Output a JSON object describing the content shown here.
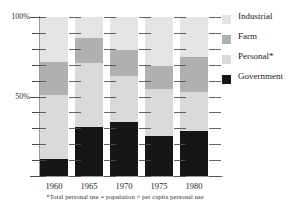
{
  "chart_data": {
    "type": "bar",
    "subtype": "stacked-percentage",
    "title": "",
    "xlabel": "",
    "ylabel": "",
    "categories": [
      "1960",
      "1965",
      "1970",
      "1975",
      "1980"
    ],
    "ylim": [
      0,
      100
    ],
    "ytick_values": [
      0,
      10,
      20,
      30,
      40,
      50,
      60,
      70,
      80,
      90,
      100
    ],
    "ytick_labels_shown": [
      "50%",
      "100%"
    ],
    "grid": false,
    "legend_position": "right",
    "units": "percent",
    "series": [
      {
        "name": "Government",
        "color": "#161616",
        "values": [
          11,
          31,
          34,
          25,
          28
        ]
      },
      {
        "name": "Personal*",
        "color": "#d9d9d9",
        "values": [
          40,
          40,
          29,
          30,
          25
        ]
      },
      {
        "name": "Farm",
        "color": "#b0b0b0",
        "values": [
          21,
          16,
          16,
          14,
          22
        ]
      },
      {
        "name": "Industrial",
        "color": "#e4e4e4",
        "values": [
          28,
          13,
          21,
          31,
          25
        ]
      }
    ]
  },
  "axes": {
    "y_labels": [
      {
        "text": "100%",
        "value": 100
      },
      {
        "text": "50%",
        "value": 50
      }
    ],
    "x_labels": [
      "1960",
      "1965",
      "1970",
      "1975",
      "1980"
    ]
  },
  "legend": {
    "items": [
      {
        "label": "Industrial",
        "color": "#e4e4e4"
      },
      {
        "label": "Farm",
        "color": "#b0b0b0"
      },
      {
        "label": "Personal*",
        "color": "#d9d9d9"
      },
      {
        "label": "Government",
        "color": "#161616"
      }
    ]
  },
  "footnote": {
    "text": "*Total personal use = population × per capita personal use"
  },
  "colors": {
    "industrial": "#e4e4e4",
    "farm": "#b0b0b0",
    "personal": "#d9d9d9",
    "government": "#161616",
    "axis": "#9a9a9a",
    "tick": "#4a4a4a",
    "text": "#1a1a1a"
  }
}
